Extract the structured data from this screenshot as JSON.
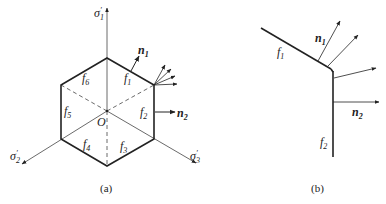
{
  "figure_a": {
    "caption": "(a)",
    "axes": [
      {
        "symbol": "σ",
        "sub": "1",
        "prime": "′"
      },
      {
        "symbol": "σ",
        "sub": "2",
        "prime": "′"
      },
      {
        "symbol": "σ",
        "sub": "3",
        "prime": "′"
      }
    ],
    "origin_label": "O",
    "faces": [
      {
        "symbol": "f",
        "sub": "1"
      },
      {
        "symbol": "f",
        "sub": "2"
      },
      {
        "symbol": "f",
        "sub": "3"
      },
      {
        "symbol": "f",
        "sub": "4"
      },
      {
        "symbol": "f",
        "sub": "5"
      },
      {
        "symbol": "f",
        "sub": "6"
      }
    ],
    "normals": [
      {
        "symbol": "n",
        "sub": "1"
      },
      {
        "symbol": "n",
        "sub": "2"
      }
    ]
  },
  "figure_b": {
    "caption": "(b)",
    "faces": [
      {
        "symbol": "f",
        "sub": "1"
      },
      {
        "symbol": "f",
        "sub": "2"
      }
    ],
    "normals": [
      {
        "symbol": "n",
        "sub": "1"
      },
      {
        "symbol": "n",
        "sub": "2"
      }
    ]
  },
  "colors": {
    "line": "#222222",
    "thin": "#444444"
  }
}
